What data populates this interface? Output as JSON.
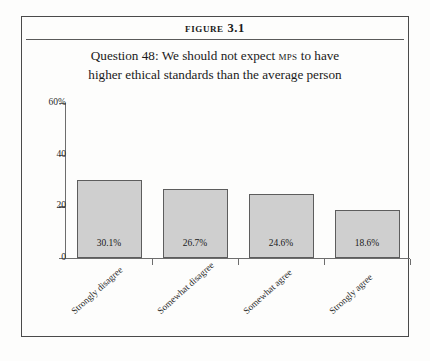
{
  "figure": {
    "number": "Figure 3.1",
    "question_line1_pre": "Question 48: We should not expect ",
    "question_mps": "MPs",
    "question_line1_post": " to have",
    "question_line2": "higher ethical standards than the average person",
    "question_full": "Question 48: We should not expect MPs to have higher ethical standards than the average person"
  },
  "chart_data": {
    "type": "bar",
    "title": "Question 48: We should not expect MPs to have higher ethical standards than the average person",
    "categories": [
      "Strongly disagree",
      "Somewhat disagree",
      "Somewhat agree",
      "Strongly agree"
    ],
    "values": [
      30.1,
      26.7,
      24.6,
      18.6
    ],
    "value_labels": [
      "30.1%",
      "26.7%",
      "24.6%",
      "18.6%"
    ],
    "xlabel": "",
    "ylabel": "",
    "ylim": [
      0,
      60
    ],
    "yticks": [
      0,
      20,
      40,
      60
    ],
    "ytick_labels": [
      "0",
      "20",
      "40",
      "60%"
    ],
    "grid": false,
    "legend": false,
    "bar_fill": "#cfcfcf",
    "bar_stroke": "#5d5d5d",
    "axis_color": "#6d6d6d"
  }
}
